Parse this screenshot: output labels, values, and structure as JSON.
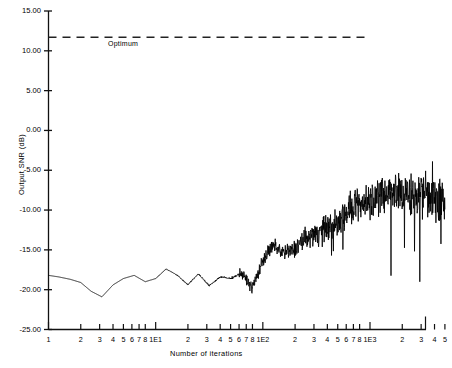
{
  "chart_data": {
    "type": "line",
    "title": "",
    "xlabel": "Number of iterations",
    "ylabel": "Output SNR (dB)",
    "xscale": "log",
    "xlim": [
      1,
      5000
    ],
    "ylim": [
      -25.0,
      15.0
    ],
    "grid": false,
    "legend_position": "none",
    "ytick_labels": [
      "15.00",
      "10.00",
      "5.00",
      "0.00",
      "-5.00",
      "-10.00",
      "-15.00",
      "-20.00",
      "-25.00"
    ],
    "ytick_values": [
      15,
      10,
      5,
      0,
      -5,
      -10,
      -15,
      -20,
      -25
    ],
    "xtick_labels": [
      "1",
      "2",
      "3",
      "4",
      "5",
      "6",
      "7",
      "8",
      "1E1",
      "2",
      "3",
      "4",
      "5",
      "6",
      "7",
      "8",
      "1E2",
      "2",
      "3",
      "4",
      "5",
      "6",
      "7",
      "8",
      "1E3",
      "2",
      "3",
      "4",
      "5"
    ],
    "xtick_values": [
      1,
      2,
      3,
      4,
      5,
      6,
      7,
      8,
      10,
      20,
      30,
      40,
      50,
      60,
      70,
      80,
      100,
      200,
      300,
      400,
      500,
      600,
      700,
      800,
      1000,
      2000,
      3000,
      4000,
      5000
    ],
    "annotations": [
      {
        "name": "optimum-line",
        "label": "Optimum",
        "type": "hline",
        "y": 11.7,
        "x_start": 1,
        "x_end": 1000,
        "style": "dashed"
      }
    ],
    "series": [
      {
        "name": "Output SNR",
        "style": "solid",
        "color": "#000000",
        "x": [
          1,
          1.25,
          1.6,
          2,
          2.5,
          3.15,
          4,
          5,
          6.3,
          8,
          10,
          12.5,
          16,
          20,
          25,
          31.5,
          40,
          50,
          63,
          80,
          100,
          125,
          160,
          200,
          250,
          315,
          400,
          500,
          630,
          800,
          1000,
          1250,
          1600,
          2000,
          2500,
          3150,
          4000,
          5000
        ],
        "y": [
          -18.2,
          -18.4,
          -18.7,
          -19.1,
          -20.2,
          -20.9,
          -19.4,
          -18.6,
          -18.2,
          -19.0,
          -18.6,
          -17.4,
          -18.2,
          -19.4,
          -18.0,
          -19.5,
          -18.4,
          -18.6,
          -17.9,
          -19.8,
          -16.3,
          -14.5,
          -15.4,
          -14.9,
          -13.6,
          -12.9,
          -12.2,
          -11.6,
          -10.1,
          -9.4,
          -8.6,
          -8.0,
          -7.4,
          -7.8,
          -8.2,
          -7.6,
          -8.4,
          -9.0
        ],
        "noise_envelope_db": 5.5,
        "description": "Adaptive filter output SNR converging from about -18 dB toward the optimum of 11.7 dB, with increasing fluctuation amplitude at higher iteration counts"
      }
    ]
  }
}
